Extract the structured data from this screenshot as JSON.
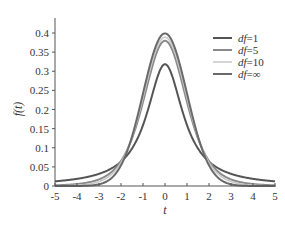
{
  "chart_data": {
    "type": "line",
    "title": "",
    "xlabel": "t",
    "ylabel": "f(t)",
    "xlim": [
      -5,
      5
    ],
    "ylim": [
      0,
      0.4
    ],
    "x_ticks": [
      "-5",
      "-4",
      "-3",
      "-2",
      "-1",
      "0",
      "1",
      "2",
      "3",
      "4",
      "5"
    ],
    "y_ticks": [
      "0",
      "0.05",
      "0.1",
      "0.15",
      "0.2",
      "0.25",
      "0.3",
      "0.35",
      "0.4"
    ],
    "grid": false,
    "legend_position": "upper right",
    "series": [
      {
        "name": "df=1",
        "df": 1,
        "color": "#555555",
        "width": 2.0,
        "peak": 0.318
      },
      {
        "name": "df=5",
        "df": 5,
        "color": "#8a8a8a",
        "width": 2.0,
        "peak": 0.38
      },
      {
        "name": "df=10",
        "df": 10,
        "color": "#c8c8c8",
        "width": 1.5,
        "peak": 0.389
      },
      {
        "name": "df=∞",
        "df": "inf",
        "color": "#6a6a6a",
        "width": 2.0,
        "peak": 0.399
      }
    ]
  },
  "legend": {
    "items": [
      {
        "prefix": "df",
        "suffix": "=1"
      },
      {
        "prefix": "df",
        "suffix": "=5"
      },
      {
        "prefix": "df",
        "suffix": "=10"
      },
      {
        "prefix": "df",
        "suffix": "=∞"
      }
    ]
  }
}
